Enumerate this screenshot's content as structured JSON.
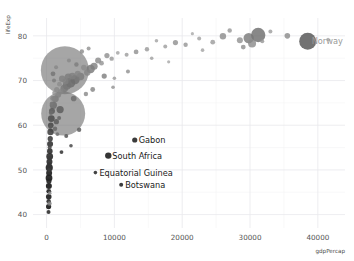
{
  "figure": {
    "background_color": "#ffffff",
    "plot_background_color": "#ffffff",
    "grid_major_color": "#e9e9ec",
    "grid_minor_color": "#f3f3f5"
  },
  "chart_data": {
    "type": "scatter",
    "title": "",
    "subtitle": "",
    "xlabel": "gdpPercap",
    "ylabel": "lifeExp",
    "xlim": [
      -2000,
      44000
    ],
    "ylim": [
      37,
      84
    ],
    "xticks": [
      0,
      10000,
      20000,
      30000,
      40000
    ],
    "xtick_labels": [
      "0",
      "10000",
      "20000",
      "30000",
      "40000"
    ],
    "yticks": [
      40,
      50,
      60,
      70,
      80
    ],
    "ytick_labels": [
      "40",
      "50",
      "60",
      "70",
      "80"
    ],
    "grid": true,
    "legend": "none",
    "size_encoding": "population",
    "color_encoding": "grayscale",
    "annotations": [
      {
        "label": "Gabon",
        "x": 13000,
        "y": 56.7,
        "color": "#1a1a1a"
      },
      {
        "label": "South Africa",
        "x": 9100,
        "y": 53.2,
        "color": "#1a1a1a"
      },
      {
        "label": "Equatorial Guinea",
        "x": 7200,
        "y": 49.4,
        "color": "#1a1a1a"
      },
      {
        "label": "Botswana",
        "x": 11000,
        "y": 46.7,
        "color": "#1a1a1a"
      },
      {
        "label": "Norway",
        "x": 38500,
        "y": 78.8,
        "color": "#9a9a9a"
      }
    ],
    "points": [
      {
        "x": 38500,
        "y": 78.8,
        "r": 8.5,
        "c": "#5e5e5e",
        "o": 0.88
      },
      {
        "x": 2700,
        "y": 72.3,
        "r": 24.0,
        "c": "#6f6f6f",
        "o": 0.62
      },
      {
        "x": 2450,
        "y": 62.6,
        "r": 22.0,
        "c": "#6f6f6f",
        "o": 0.62
      },
      {
        "x": 31200,
        "y": 80.2,
        "r": 7.2,
        "c": "#6a6a6a",
        "o": 0.8
      },
      {
        "x": 29800,
        "y": 79.5,
        "r": 5.2,
        "c": "#777777",
        "o": 0.8
      },
      {
        "x": 30300,
        "y": 78.3,
        "r": 4.0,
        "c": "#8a8a8a",
        "o": 0.8
      },
      {
        "x": 28500,
        "y": 79.0,
        "r": 3.0,
        "c": "#909090",
        "o": 0.8
      },
      {
        "x": 26000,
        "y": 79.9,
        "r": 3.2,
        "c": "#8b8b8b",
        "o": 0.8
      },
      {
        "x": 24500,
        "y": 78.6,
        "r": 2.4,
        "c": "#9a9a9a",
        "o": 0.8
      },
      {
        "x": 22500,
        "y": 79.4,
        "r": 2.0,
        "c": "#a0a0a0",
        "o": 0.8
      },
      {
        "x": 20500,
        "y": 78.0,
        "r": 2.2,
        "c": "#949494",
        "o": 0.8
      },
      {
        "x": 19000,
        "y": 78.5,
        "r": 2.6,
        "c": "#8e8e8e",
        "o": 0.8
      },
      {
        "x": 17500,
        "y": 77.6,
        "r": 2.0,
        "c": "#9c9c9c",
        "o": 0.8
      },
      {
        "x": 16200,
        "y": 78.9,
        "r": 1.8,
        "c": "#a2a2a2",
        "o": 0.8
      },
      {
        "x": 14800,
        "y": 77.0,
        "r": 2.2,
        "c": "#979797",
        "o": 0.8
      },
      {
        "x": 13200,
        "y": 76.4,
        "r": 2.4,
        "c": "#8f8f8f",
        "o": 0.8
      },
      {
        "x": 11800,
        "y": 75.8,
        "r": 2.0,
        "c": "#9b9b9b",
        "o": 0.8
      },
      {
        "x": 10500,
        "y": 76.2,
        "r": 1.9,
        "c": "#a1a1a1",
        "o": 0.8
      },
      {
        "x": 9600,
        "y": 74.9,
        "r": 2.2,
        "c": "#969696",
        "o": 0.8
      },
      {
        "x": 8900,
        "y": 75.6,
        "r": 2.6,
        "c": "#8d8d8d",
        "o": 0.8
      },
      {
        "x": 8100,
        "y": 73.9,
        "r": 2.4,
        "c": "#929292",
        "o": 0.8
      },
      {
        "x": 7600,
        "y": 74.5,
        "r": 3.0,
        "c": "#888888",
        "o": 0.8
      },
      {
        "x": 7000,
        "y": 73.2,
        "r": 3.6,
        "c": "#7e7e7e",
        "o": 0.8
      },
      {
        "x": 6500,
        "y": 72.6,
        "r": 4.2,
        "c": "#757575",
        "o": 0.8
      },
      {
        "x": 6000,
        "y": 71.8,
        "r": 3.2,
        "c": "#848484",
        "o": 0.8
      },
      {
        "x": 5500,
        "y": 72.9,
        "r": 2.8,
        "c": "#8b8b8b",
        "o": 0.8
      },
      {
        "x": 5000,
        "y": 70.9,
        "r": 3.8,
        "c": "#7a7a7a",
        "o": 0.8
      },
      {
        "x": 4600,
        "y": 71.5,
        "r": 3.0,
        "c": "#858585",
        "o": 0.8
      },
      {
        "x": 4200,
        "y": 70.2,
        "r": 4.6,
        "c": "#6e6e6e",
        "o": 0.8
      },
      {
        "x": 3800,
        "y": 71.0,
        "r": 3.4,
        "c": "#7f7f7f",
        "o": 0.8
      },
      {
        "x": 3500,
        "y": 69.5,
        "r": 5.0,
        "c": "#6a6a6a",
        "o": 0.8
      },
      {
        "x": 3200,
        "y": 70.8,
        "r": 3.6,
        "c": "#7c7c7c",
        "o": 0.8
      },
      {
        "x": 3000,
        "y": 68.9,
        "r": 4.2,
        "c": "#737373",
        "o": 0.8
      },
      {
        "x": 2800,
        "y": 69.8,
        "r": 3.0,
        "c": "#828282",
        "o": 0.8
      },
      {
        "x": 2600,
        "y": 68.2,
        "r": 3.8,
        "c": "#787878",
        "o": 0.8
      },
      {
        "x": 2300,
        "y": 70.4,
        "r": 3.2,
        "c": "#808080",
        "o": 0.8
      },
      {
        "x": 2100,
        "y": 67.5,
        "r": 2.8,
        "c": "#868686",
        "o": 0.8
      },
      {
        "x": 1900,
        "y": 69.2,
        "r": 2.4,
        "c": "#8c8c8c",
        "o": 0.8
      },
      {
        "x": 1700,
        "y": 66.8,
        "r": 3.0,
        "c": "#818181",
        "o": 0.8
      },
      {
        "x": 1500,
        "y": 68.0,
        "r": 2.6,
        "c": "#898989",
        "o": 0.8
      },
      {
        "x": 1300,
        "y": 65.9,
        "r": 3.4,
        "c": "#7b7b7b",
        "o": 0.8
      },
      {
        "x": 1150,
        "y": 67.2,
        "r": 2.2,
        "c": "#909090",
        "o": 0.8
      },
      {
        "x": 1000,
        "y": 64.5,
        "r": 3.6,
        "c": "#6d6d6d",
        "o": 0.85
      },
      {
        "x": 900,
        "y": 66.0,
        "r": 2.4,
        "c": "#858585",
        "o": 0.85
      },
      {
        "x": 800,
        "y": 63.2,
        "r": 3.0,
        "c": "#5a5a5a",
        "o": 0.85
      },
      {
        "x": 750,
        "y": 64.8,
        "r": 2.0,
        "c": "#7a7a7a",
        "o": 0.85
      },
      {
        "x": 700,
        "y": 61.5,
        "r": 3.4,
        "c": "#4e4e4e",
        "o": 0.88
      },
      {
        "x": 650,
        "y": 62.8,
        "r": 2.2,
        "c": "#6c6c6c",
        "o": 0.88
      },
      {
        "x": 620,
        "y": 60.0,
        "r": 2.8,
        "c": "#4a4a4a",
        "o": 0.88
      },
      {
        "x": 580,
        "y": 58.5,
        "r": 3.2,
        "c": "#3f3f3f",
        "o": 0.88
      },
      {
        "x": 560,
        "y": 59.6,
        "r": 2.0,
        "c": "#5c5c5c",
        "o": 0.88
      },
      {
        "x": 540,
        "y": 57.0,
        "r": 2.6,
        "c": "#3a3a3a",
        "o": 0.9
      },
      {
        "x": 520,
        "y": 55.8,
        "r": 3.0,
        "c": "#333333",
        "o": 0.9
      },
      {
        "x": 500,
        "y": 56.9,
        "r": 1.8,
        "c": "#555555",
        "o": 0.9
      },
      {
        "x": 480,
        "y": 54.2,
        "r": 2.8,
        "c": "#2e2e2e",
        "o": 0.9
      },
      {
        "x": 460,
        "y": 53.0,
        "r": 3.4,
        "c": "#2a2a2a",
        "o": 0.9
      },
      {
        "x": 450,
        "y": 55.0,
        "r": 2.0,
        "c": "#4c4c4c",
        "o": 0.9
      },
      {
        "x": 430,
        "y": 51.8,
        "r": 3.0,
        "c": "#282828",
        "o": 0.9
      },
      {
        "x": 420,
        "y": 52.6,
        "r": 2.2,
        "c": "#3b3b3b",
        "o": 0.9
      },
      {
        "x": 400,
        "y": 50.5,
        "r": 3.6,
        "c": "#232323",
        "o": 0.92
      },
      {
        "x": 390,
        "y": 51.2,
        "r": 2.4,
        "c": "#343434",
        "o": 0.92
      },
      {
        "x": 380,
        "y": 49.3,
        "r": 3.0,
        "c": "#1f1f1f",
        "o": 0.92
      },
      {
        "x": 370,
        "y": 50.0,
        "r": 2.0,
        "c": "#3d3d3d",
        "o": 0.92
      },
      {
        "x": 360,
        "y": 48.2,
        "r": 3.4,
        "c": "#1c1c1c",
        "o": 0.92
      },
      {
        "x": 350,
        "y": 47.5,
        "r": 2.6,
        "c": "#262626",
        "o": 0.92
      },
      {
        "x": 340,
        "y": 46.4,
        "r": 3.0,
        "c": "#1a1a1a",
        "o": 0.92
      },
      {
        "x": 330,
        "y": 45.2,
        "r": 2.4,
        "c": "#222222",
        "o": 0.92
      },
      {
        "x": 320,
        "y": 44.0,
        "r": 2.8,
        "c": "#1e1e1e",
        "o": 0.92
      },
      {
        "x": 310,
        "y": 43.0,
        "r": 2.2,
        "c": "#2b2b2b",
        "o": 0.92
      },
      {
        "x": 300,
        "y": 41.8,
        "r": 2.6,
        "c": "#1a1a1a",
        "o": 0.92
      },
      {
        "x": 290,
        "y": 40.6,
        "r": 2.0,
        "c": "#333333",
        "o": 0.92
      },
      {
        "x": 430,
        "y": 42.5,
        "r": 2.2,
        "c": "#808080",
        "o": 0.85
      },
      {
        "x": 470,
        "y": 44.8,
        "r": 1.8,
        "c": "#8e8e8e",
        "o": 0.85
      },
      {
        "x": 1250,
        "y": 59.2,
        "r": 2.2,
        "c": "#6a6a6a",
        "o": 0.88
      },
      {
        "x": 1450,
        "y": 60.8,
        "r": 2.6,
        "c": "#5e5e5e",
        "o": 0.88
      },
      {
        "x": 1600,
        "y": 58.0,
        "r": 1.8,
        "c": "#727272",
        "o": 0.88
      },
      {
        "x": 1850,
        "y": 61.6,
        "r": 2.0,
        "c": "#666666",
        "o": 0.88
      },
      {
        "x": 13000,
        "y": 56.7,
        "r": 2.6,
        "c": "#2a2a2a",
        "o": 0.92
      },
      {
        "x": 9100,
        "y": 53.2,
        "r": 3.2,
        "c": "#242424",
        "o": 0.92
      },
      {
        "x": 7200,
        "y": 49.4,
        "r": 1.8,
        "c": "#333333",
        "o": 0.92
      },
      {
        "x": 11000,
        "y": 46.7,
        "r": 2.0,
        "c": "#2b2b2b",
        "o": 0.92
      },
      {
        "x": 2900,
        "y": 57.6,
        "r": 2.0,
        "c": "#5a5a5a",
        "o": 0.88
      },
      {
        "x": 3600,
        "y": 55.4,
        "r": 1.8,
        "c": "#4f4f4f",
        "o": 0.88
      },
      {
        "x": 4800,
        "y": 59.0,
        "r": 2.2,
        "c": "#636363",
        "o": 0.88
      },
      {
        "x": 2200,
        "y": 54.0,
        "r": 1.9,
        "c": "#3c3c3c",
        "o": 0.9
      },
      {
        "x": 5800,
        "y": 67.0,
        "r": 2.2,
        "c": "#8a8a8a",
        "o": 0.82
      },
      {
        "x": 35500,
        "y": 80.0,
        "r": 2.8,
        "c": "#8a8a8a",
        "o": 0.8
      },
      {
        "x": 41500,
        "y": 79.2,
        "r": 1.8,
        "c": "#a5a5a5",
        "o": 0.8
      },
      {
        "x": 33000,
        "y": 81.0,
        "r": 2.0,
        "c": "#9c9c9c",
        "o": 0.8
      },
      {
        "x": 27000,
        "y": 81.2,
        "r": 2.2,
        "c": "#969696",
        "o": 0.8
      },
      {
        "x": 21500,
        "y": 80.5,
        "r": 1.6,
        "c": "#a8a8a8",
        "o": 0.8
      },
      {
        "x": 15500,
        "y": 75.0,
        "r": 1.8,
        "c": "#9e9e9e",
        "o": 0.8
      },
      {
        "x": 12000,
        "y": 72.0,
        "r": 2.0,
        "c": "#8f8f8f",
        "o": 0.8
      },
      {
        "x": 10000,
        "y": 70.5,
        "r": 1.8,
        "c": "#999999",
        "o": 0.8
      },
      {
        "x": 6800,
        "y": 68.0,
        "r": 2.4,
        "c": "#858585",
        "o": 0.82
      },
      {
        "x": 4000,
        "y": 66.0,
        "r": 2.8,
        "c": "#6f6f6f",
        "o": 0.85
      },
      {
        "x": 2000,
        "y": 63.5,
        "r": 3.6,
        "c": "#5f5f5f",
        "o": 0.86
      },
      {
        "x": 1100,
        "y": 70.0,
        "r": 2.0,
        "c": "#7d7d7d",
        "o": 0.85
      },
      {
        "x": 950,
        "y": 71.5,
        "r": 2.4,
        "c": "#767676",
        "o": 0.85
      },
      {
        "x": 1400,
        "y": 73.0,
        "r": 2.0,
        "c": "#888888",
        "o": 0.85
      },
      {
        "x": 5200,
        "y": 76.5,
        "r": 2.2,
        "c": "#8c8c8c",
        "o": 0.82
      },
      {
        "x": 6200,
        "y": 77.2,
        "r": 2.0,
        "c": "#939393",
        "o": 0.82
      },
      {
        "x": 8500,
        "y": 71.0,
        "r": 2.6,
        "c": "#7f7f7f",
        "o": 0.82
      },
      {
        "x": 9800,
        "y": 68.5,
        "r": 1.8,
        "c": "#929292",
        "o": 0.82
      },
      {
        "x": 3300,
        "y": 74.5,
        "r": 2.0,
        "c": "#898989",
        "o": 0.82
      },
      {
        "x": 4400,
        "y": 73.6,
        "r": 2.2,
        "c": "#7e7e7e",
        "o": 0.82
      },
      {
        "x": 23000,
        "y": 76.8,
        "r": 1.8,
        "c": "#a3a3a3",
        "o": 0.8
      },
      {
        "x": 18000,
        "y": 74.2,
        "r": 1.6,
        "c": "#a6a6a6",
        "o": 0.8
      },
      {
        "x": 29000,
        "y": 77.5,
        "r": 2.4,
        "c": "#8d8d8d",
        "o": 0.8
      },
      {
        "x": 31800,
        "y": 78.8,
        "r": 2.0,
        "c": "#969696",
        "o": 0.8
      }
    ]
  }
}
